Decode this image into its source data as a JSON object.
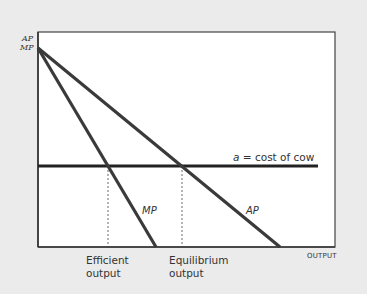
{
  "diagram": {
    "y_axis_label_line1": "AP",
    "y_axis_label_line2": "MP",
    "x_axis_label": "OUTPUT",
    "cost_line": {
      "variable": "a",
      "equals": "=",
      "text": "cost of cow"
    },
    "curves": {
      "mp": "MP",
      "ap": "AP"
    },
    "markers": {
      "efficient_line1": "Efficient",
      "efficient_line2": "output",
      "equilibrium_line1": "Equilibrium",
      "equilibrium_line2": "output"
    },
    "colors": {
      "background": "#ebebeb",
      "plot_background": "#ffffff",
      "curve": "#333333",
      "frame": "#333333"
    }
  }
}
